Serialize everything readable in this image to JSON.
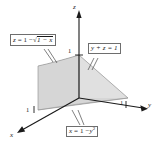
{
  "figure": {
    "name": "solid-region-3d-diagram",
    "background_color": "#ffffff",
    "line_color": "#1a1a1a",
    "callout_border_color": "#6e6e6e",
    "face_colors": {
      "top_surface": "#d8d8d8",
      "left_vertical_face": "#b9b9b9",
      "front_lower_face": "#cfcfcf",
      "base_face": "#c4c4c4",
      "right_face": "#e2e2e2"
    }
  },
  "axes": [
    {
      "id": "z",
      "label": "z",
      "tick": "1"
    },
    {
      "id": "y",
      "label": "y",
      "tick": "1"
    },
    {
      "id": "x",
      "label": "x",
      "tick": "1"
    }
  ],
  "axis_labels": {
    "z": "z",
    "y": "y",
    "x": "x"
  },
  "tick_labels": {
    "z": "1",
    "y": "1",
    "x": "1"
  },
  "callouts": [
    {
      "id": "z-curve",
      "text": "z = 1 − √(1 − x)",
      "parts": {
        "lhs": "z",
        "eq": "= 1 −",
        "radicand": "1 − x"
      }
    },
    {
      "id": "yz-plane",
      "text": "y + z = 1",
      "parts": {
        "lhs": "y + z",
        "eq": "= 1"
      }
    },
    {
      "id": "x-parabola",
      "text": "x = 1 − y²",
      "parts": {
        "lhs": "x",
        "eq": "= 1 −",
        "base": "y",
        "exponent": "2"
      }
    }
  ],
  "callout_text": {
    "z_curve_lhs": "z",
    "z_curve_eq": "= 1 −",
    "z_curve_radicand": "1 − x",
    "yz_full": "y + z = 1",
    "x_par_lhs": "x",
    "x_par_eq": "= 1 −",
    "x_par_base": "y",
    "x_par_exp": "2"
  }
}
